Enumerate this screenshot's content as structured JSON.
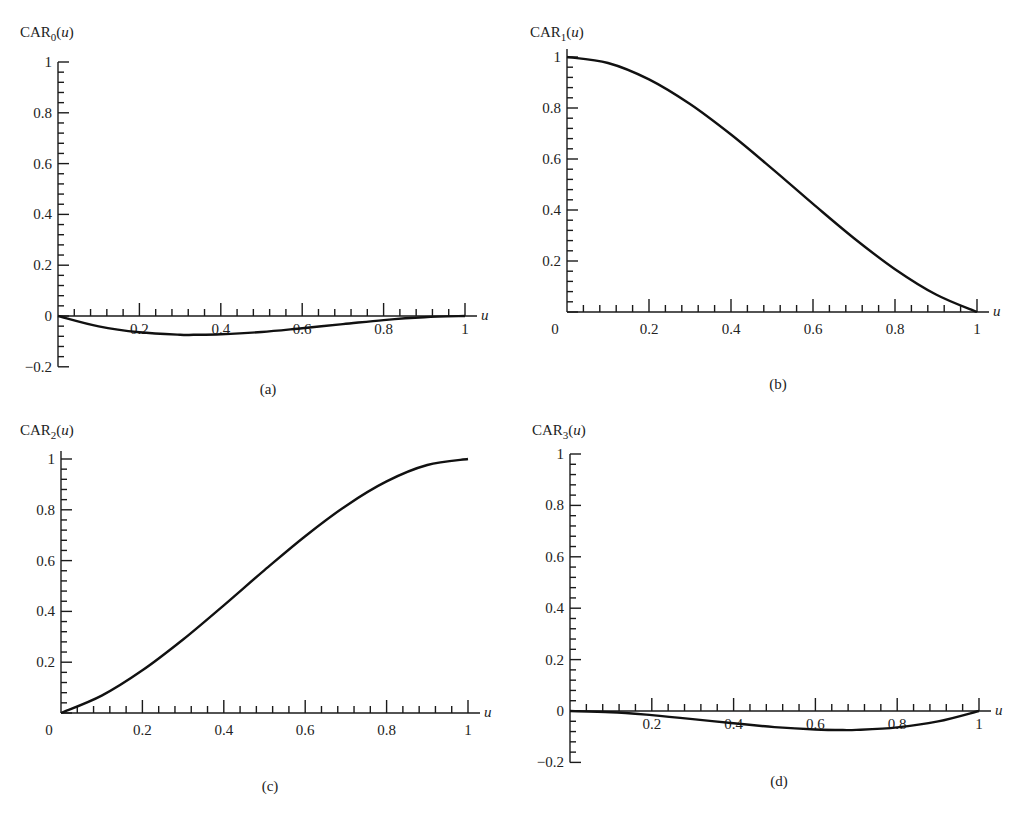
{
  "figure": {
    "panels": [
      {
        "id": "a",
        "ylabel_main": "CAR",
        "ylabel_sub": "0",
        "ylabel_arg": "(u)",
        "caption": "(a)",
        "xlabel": "u"
      },
      {
        "id": "b",
        "ylabel_main": "CAR",
        "ylabel_sub": "1",
        "ylabel_arg": "(u)",
        "caption": "(b)",
        "xlabel": "u"
      },
      {
        "id": "c",
        "ylabel_main": "CAR",
        "ylabel_sub": "2",
        "ylabel_arg": "(u)",
        "caption": "(c)",
        "xlabel": "u"
      },
      {
        "id": "d",
        "ylabel_main": "CAR",
        "ylabel_sub": "3",
        "ylabel_arg": "(u)",
        "caption": "(d)",
        "xlabel": "u"
      }
    ]
  },
  "chart_data": [
    {
      "type": "line",
      "title": "(a)",
      "xlabel": "u",
      "ylabel": "CAR0(u)",
      "xlim": [
        0,
        1
      ],
      "ylim": [
        -0.2,
        1
      ],
      "xticks": [
        "0.2",
        "0.4",
        "0.6",
        "0.8",
        "1"
      ],
      "yticks": [
        "-0.2",
        "0",
        "0.2",
        "0.4",
        "0.6",
        "0.8",
        "1"
      ],
      "minor_tick_step": 0.04,
      "grid": false,
      "x": [
        0,
        0.1,
        0.2,
        0.3,
        0.333,
        0.4,
        0.5,
        0.6,
        0.7,
        0.8,
        0.9,
        1.0
      ],
      "y": [
        0,
        -0.041,
        -0.064,
        -0.074,
        -0.074,
        -0.072,
        -0.063,
        -0.048,
        -0.032,
        -0.016,
        -0.005,
        0
      ],
      "frame": {
        "x0": 58,
        "x1": 465,
        "y_at_0": 316,
        "y_at_1": 62,
        "ymin_val": -0.2,
        "ymax_val": 1,
        "x_labels_under_curve": true
      },
      "label_pos": {
        "x": 20,
        "y": 37
      },
      "caption_pos": {
        "x": 268,
        "y": 394
      }
    },
    {
      "type": "line",
      "title": "(b)",
      "xlabel": "u",
      "ylabel": "CAR1(u)",
      "xlim": [
        0,
        1
      ],
      "ylim": [
        0,
        1
      ],
      "xticks": [
        "0",
        "0.2",
        "0.4",
        "0.6",
        "0.8",
        "1"
      ],
      "yticks": [
        "0.2",
        "0.4",
        "0.6",
        "0.8",
        "1"
      ],
      "minor_tick_step": 0.04,
      "grid": false,
      "x": [
        0,
        0.1,
        0.2,
        0.3,
        0.4,
        0.5,
        0.6,
        0.7,
        0.8,
        0.9,
        1.0
      ],
      "y": [
        1.0,
        0.9765,
        0.912,
        0.8155,
        0.696,
        0.5625,
        0.424,
        0.2895,
        0.168,
        0.0685,
        0
      ],
      "frame": {
        "x0": 567,
        "x1": 977,
        "y_at_0": 312,
        "y_at_1": 57,
        "ymin_val": 0,
        "ymax_val": 1,
        "x_labels_under_curve": false
      },
      "label_pos": {
        "x": 530,
        "y": 37
      },
      "caption_pos": {
        "x": 778,
        "y": 389
      }
    },
    {
      "type": "line",
      "title": "(c)",
      "xlabel": "u",
      "ylabel": "CAR2(u)",
      "xlim": [
        0,
        1
      ],
      "ylim": [
        0,
        1
      ],
      "xticks": [
        "0",
        "0.2",
        "0.4",
        "0.6",
        "0.8",
        "1"
      ],
      "yticks": [
        "0.2",
        "0.4",
        "0.6",
        "0.8",
        "1"
      ],
      "minor_tick_step": 0.04,
      "grid": false,
      "x": [
        0,
        0.1,
        0.2,
        0.3,
        0.4,
        0.5,
        0.6,
        0.7,
        0.8,
        0.9,
        1.0
      ],
      "y": [
        0,
        0.0685,
        0.168,
        0.2895,
        0.424,
        0.5625,
        0.696,
        0.8155,
        0.912,
        0.9765,
        1.0
      ],
      "frame": {
        "x0": 61,
        "x1": 468,
        "y_at_0": 713,
        "y_at_1": 459,
        "ymin_val": 0,
        "ymax_val": 1,
        "x_labels_under_curve": false
      },
      "label_pos": {
        "x": 20,
        "y": 435
      },
      "caption_pos": {
        "x": 270,
        "y": 791
      }
    },
    {
      "type": "line",
      "title": "(d)",
      "xlabel": "u",
      "ylabel": "CAR3(u)",
      "xlim": [
        0,
        1
      ],
      "ylim": [
        -0.2,
        1
      ],
      "xticks": [
        "0.2",
        "0.4",
        "0.6",
        "0.8",
        "1"
      ],
      "yticks": [
        "-0.2",
        "0",
        "0.2",
        "0.4",
        "0.6",
        "0.8",
        "1"
      ],
      "minor_tick_step": 0.04,
      "grid": false,
      "x": [
        0,
        0.1,
        0.2,
        0.3,
        0.4,
        0.5,
        0.6,
        0.667,
        0.7,
        0.8,
        0.9,
        1.0
      ],
      "y": [
        0,
        -0.0045,
        -0.016,
        -0.0315,
        -0.048,
        -0.0625,
        -0.072,
        -0.074,
        -0.0735,
        -0.064,
        -0.0405,
        0
      ],
      "frame": {
        "x0": 570,
        "x1": 979,
        "y_at_0": 711,
        "y_at_1": 454,
        "ymin_val": -0.2,
        "ymax_val": 1,
        "x_labels_under_curve": true
      },
      "label_pos": {
        "x": 532,
        "y": 435
      },
      "caption_pos": {
        "x": 779,
        "y": 786
      }
    }
  ]
}
